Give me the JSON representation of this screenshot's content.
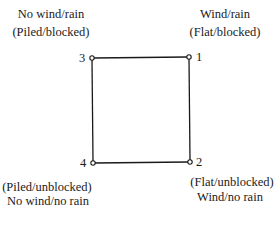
{
  "diagram": {
    "corners": {
      "top_left": {
        "vertex": "3",
        "condition": "No wind/rain",
        "state": "(Piled/blocked)"
      },
      "top_right": {
        "vertex": "1",
        "condition": "Wind/rain",
        "state": "(Flat/blocked)"
      },
      "bottom_left": {
        "vertex": "4",
        "state": "(Piled/unblocked)",
        "condition": "No wind/no rain"
      },
      "bottom_right": {
        "vertex": "2",
        "state": "(Flat/unblocked)",
        "condition": "Wind/no rain"
      }
    },
    "line_color": "#1a1a1a",
    "background": "#ffffff"
  }
}
